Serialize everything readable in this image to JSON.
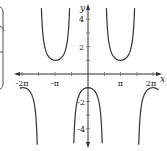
{
  "chart_data": {
    "type": "line",
    "title": "",
    "function": "y = -sec(x)",
    "xlabel": "x",
    "ylabel": "y",
    "xlim": [
      -6.6,
      6.8
    ],
    "ylim": [
      -5,
      5
    ],
    "grid": false,
    "x_ticks": [
      {
        "value": -6.2832,
        "label": "-2π"
      },
      {
        "value": -3.1416,
        "label": "-π"
      },
      {
        "value": 3.1416,
        "label": "π"
      },
      {
        "value": 6.2832,
        "label": "2π"
      }
    ],
    "y_ticks": [
      {
        "value": 4,
        "label": "4"
      },
      {
        "value": 2,
        "label": "2"
      },
      {
        "value": -2,
        "label": "-2"
      },
      {
        "value": -4,
        "label": "-4"
      }
    ],
    "asymptotes": [
      -4.7124,
      -1.5708,
      1.5708,
      4.7124
    ],
    "key_points": [
      {
        "x": -6.2832,
        "y": -1
      },
      {
        "x": -3.1416,
        "y": 1
      },
      {
        "x": 0,
        "y": -1
      },
      {
        "x": 3.1416,
        "y": 1
      },
      {
        "x": 6.2832,
        "y": -1
      }
    ],
    "series": [
      {
        "name": "y = -sec(x)",
        "color": "#333333"
      }
    ]
  },
  "labels": {
    "x_axis": "x",
    "y_axis": "y",
    "x_ticks": [
      "-2π",
      "-π",
      "π",
      "2π"
    ],
    "y_ticks": [
      "4",
      "2",
      "-2",
      "-4"
    ]
  }
}
